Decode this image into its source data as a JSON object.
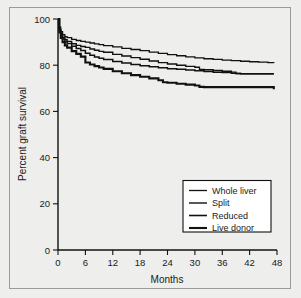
{
  "chart_data": {
    "type": "line",
    "title": "",
    "xlabel": "Months",
    "ylabel": "Percent graft survival",
    "xlim": [
      0,
      48
    ],
    "ylim": [
      0,
      100
    ],
    "xticks": [
      0,
      6,
      12,
      18,
      24,
      30,
      36,
      42,
      48
    ],
    "yticks": [
      0,
      20,
      40,
      60,
      80,
      100
    ],
    "xtick_labels": [
      "0",
      "6",
      "12",
      "18",
      "24",
      "30",
      "36",
      "42",
      "48"
    ],
    "ytick_labels": [
      "0",
      "20",
      "40",
      "60",
      "80",
      "100"
    ],
    "grid": false,
    "legend_position": "lower right",
    "series": [
      {
        "name": "Whole liver",
        "x": [
          0,
          0.3,
          0.6,
          1,
          1.5,
          2,
          3,
          4,
          5,
          6,
          7,
          8,
          9,
          10,
          12,
          14,
          16,
          18,
          20,
          22,
          24,
          26,
          28,
          30,
          32,
          34,
          36,
          38,
          40,
          42,
          44,
          46,
          47.3
        ],
        "y": [
          100,
          96.5,
          94.5,
          93.2,
          92.4,
          91.9,
          91.2,
          90.7,
          90.3,
          90.0,
          89.6,
          89.2,
          88.9,
          88.5,
          87.9,
          87.3,
          86.8,
          86.3,
          85.7,
          85.1,
          84.6,
          84.1,
          83.6,
          83.2,
          82.8,
          82.5,
          82.2,
          82.0,
          81.7,
          81.5,
          81.3,
          81.1,
          80.9
        ]
      },
      {
        "name": "Split",
        "x": [
          0,
          0.3,
          0.6,
          1,
          1.5,
          2,
          3,
          4,
          5,
          6,
          7,
          8,
          9,
          10,
          12,
          14,
          16,
          18,
          20,
          22,
          24,
          26,
          28,
          30,
          31,
          32,
          34,
          36,
          38,
          39,
          40,
          42,
          44,
          46,
          47.3
        ],
        "y": [
          100,
          95.5,
          93.4,
          92.0,
          91.0,
          90.3,
          89.3,
          88.6,
          88.1,
          87.7,
          87.0,
          86.5,
          86.0,
          85.6,
          84.7,
          84.0,
          83.3,
          82.6,
          81.8,
          81.1,
          80.5,
          80.0,
          79.5,
          79.1,
          78.2,
          78.0,
          77.7,
          77.4,
          77.0,
          76.4,
          76.3,
          76.3,
          76.3,
          76.3,
          76.3
        ]
      },
      {
        "name": "Reduced",
        "x": [
          0,
          0.3,
          0.6,
          1,
          1.5,
          2,
          3,
          4,
          5,
          6,
          7,
          8,
          9,
          10,
          12,
          14,
          16,
          18,
          20,
          22,
          24,
          26,
          28,
          30,
          32,
          34,
          36,
          38,
          39,
          40,
          42,
          44,
          46,
          47.3
        ],
        "y": [
          100,
          95.0,
          92.8,
          91.3,
          90.2,
          89.4,
          88.2,
          87.2,
          86.4,
          85.2,
          84.3,
          83.6,
          83.0,
          82.5,
          81.6,
          80.9,
          80.3,
          79.8,
          79.3,
          78.9,
          78.5,
          78.2,
          77.9,
          77.6,
          77.3,
          77.0,
          76.8,
          76.5,
          76.4,
          76.3,
          76.3,
          76.3,
          76.3,
          76.3
        ]
      },
      {
        "name": "Live donor",
        "x": [
          0,
          0.3,
          0.6,
          1,
          1.5,
          2,
          3,
          4,
          5,
          6,
          7,
          8,
          9,
          10,
          12,
          14,
          16,
          18,
          20,
          22,
          23,
          24,
          26,
          28,
          30,
          31,
          32,
          34,
          36,
          38,
          40,
          42,
          44,
          46,
          47,
          47.3
        ],
        "y": [
          100,
          94.2,
          91.8,
          90.0,
          88.6,
          87.6,
          86.1,
          84.9,
          83.7,
          81.2,
          80.3,
          79.6,
          79.0,
          78.4,
          77.4,
          76.5,
          75.7,
          75.0,
          74.3,
          73.5,
          72.6,
          72.4,
          72.0,
          71.6,
          71.2,
          70.6,
          70.5,
          70.5,
          70.5,
          70.5,
          70.5,
          70.5,
          70.5,
          70.5,
          70.5,
          69.6
        ]
      }
    ],
    "legend_entries": [
      "Whole liver",
      "Split",
      "Reduced",
      "Live donor"
    ],
    "series_stroke_widths": [
      1.3,
      1.4,
      1.5,
      2.1
    ],
    "color": "#111111"
  }
}
